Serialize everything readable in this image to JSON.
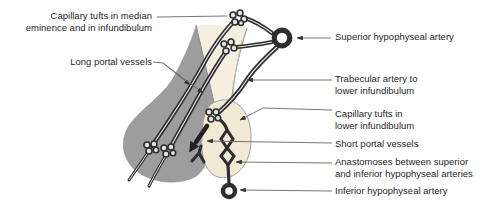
{
  "figure": {
    "labels": [
      {
        "id": "capillary-tufts-median",
        "text": "Capillary tufts in median\neminence and in infundibulum"
      },
      {
        "id": "long-portal-vessels",
        "text": "Long portal vessels"
      },
      {
        "id": "superior-hypophyseal-artery",
        "text": "Superior hypophyseal artery"
      },
      {
        "id": "trabecular-artery",
        "text": "Trabecular artery to\nlower infundibulum"
      },
      {
        "id": "capillary-tufts-lower",
        "text": "Capillary tufts in\nlower infundibulum"
      },
      {
        "id": "short-portal-vessels",
        "text": "Short portal vessels"
      },
      {
        "id": "anastomoses",
        "text": "Anastomoses between superior\nand inferior hypophyseal arteries"
      },
      {
        "id": "inferior-hypophyseal-artery",
        "text": "Inferior hypophyseal artery"
      }
    ],
    "colors": {
      "vessel": "#2e2e2e",
      "vessel_core": "#e2e2e2",
      "gland_anterior": "#9d9d9d",
      "gland_posterior": "#efe9d6",
      "funnel": "#f4efdf",
      "leader": "#666666",
      "text": "#1f1f1f",
      "background": "#ffffff"
    }
  }
}
